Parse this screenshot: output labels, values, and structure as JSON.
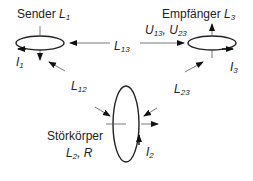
{
  "diagram": {
    "nodes": {
      "sender": {
        "name": "Sender",
        "symbol": "L",
        "index": "1",
        "current": "I",
        "current_index": "1"
      },
      "receiver": {
        "name": "Empfänger",
        "symbol": "L",
        "index": "3",
        "current": "I",
        "current_index": "3"
      },
      "disturber": {
        "name": "Störkörper",
        "symbol": "L",
        "index": "2",
        "extra": ", R",
        "current": "I",
        "current_index": "2"
      }
    },
    "couplings": {
      "l13": {
        "symbol": "L",
        "index": "13"
      },
      "l12": {
        "symbol": "L",
        "index": "12"
      },
      "l23": {
        "symbol": "L",
        "index": "23"
      }
    },
    "voltages": {
      "u13": "U",
      "u13_index": "13",
      "sep": ", ",
      "u23": "U",
      "u23_index": "23"
    }
  }
}
